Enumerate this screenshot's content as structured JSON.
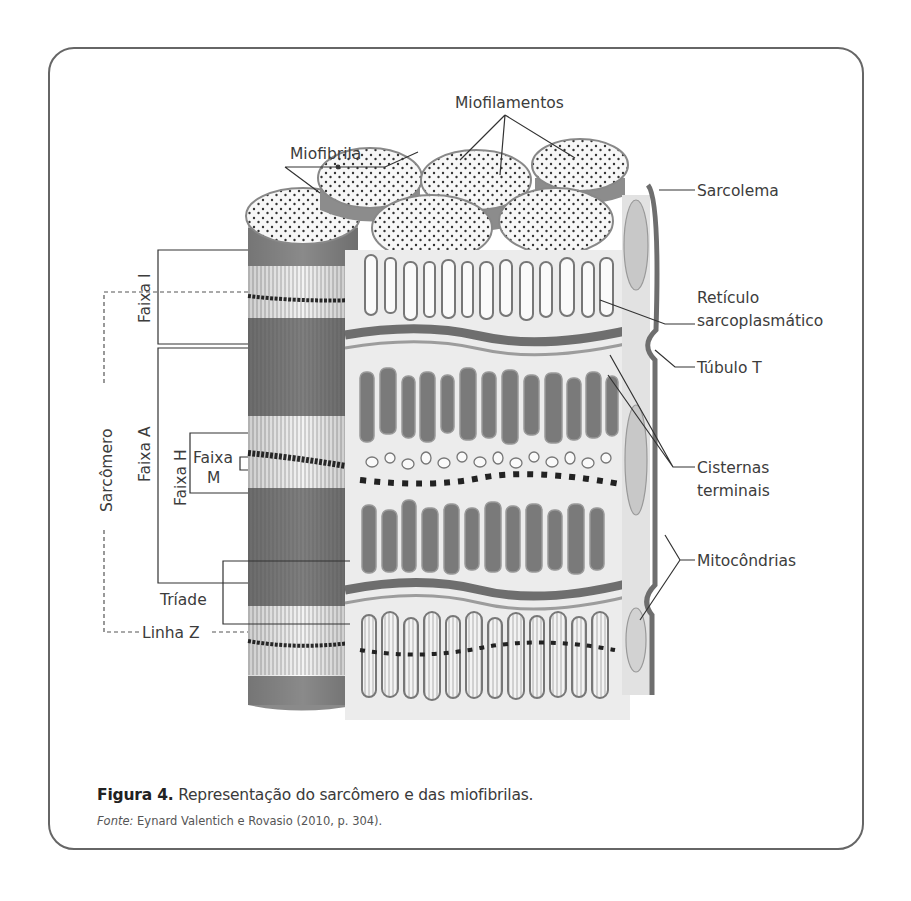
{
  "figure": {
    "labels": {
      "miofibrila": "Miofibrila",
      "miofilamentos": "Miofilamentos",
      "sarcolema": "Sarcolema",
      "reticulo_line1": "Retículo",
      "reticulo_line2": "sarcoplasmático",
      "tubulo_t": "Túbulo T",
      "cisternas_line1": "Cisternas",
      "cisternas_line2": "terminais",
      "mitocondrias": "Mitocôndrias",
      "faixa_i": "Faixa I",
      "faixa_a": "Faixa A",
      "faixa_h": "Faixa H",
      "faixa_m_line1": "Faixa",
      "faixa_m_line2": "M",
      "sarcomero": "Sarcômero",
      "triade": "Tríade",
      "linha_z": "Linha Z"
    },
    "colors": {
      "frame": "#666666",
      "dark_band": "#7d7d7d",
      "light_band": "#f1f1f1",
      "membrane": "#6e6e6e",
      "text": "#3c3c3c"
    }
  },
  "caption": {
    "label": "Figura 4.",
    "text": " Representação do sarcômero e das miofibrilas.",
    "source_label": "Fonte:",
    "source_text": " Eynard Valentich e Rovasio (2010, p. 304)."
  }
}
